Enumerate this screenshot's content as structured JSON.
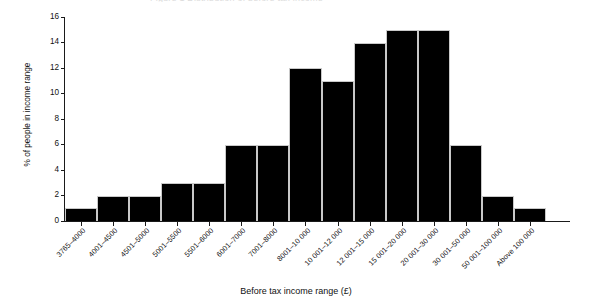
{
  "figure": {
    "title_remnant": "Figure 1  Distribution of before tax income",
    "background_color": "#ffffff",
    "bar_color": "#000000",
    "axis_color": "#1a1a1a"
  },
  "chart_data": {
    "type": "bar",
    "title": "",
    "xlabel": "Before tax income range (£)",
    "ylabel": "% of people in income range",
    "ylim": [
      0,
      16
    ],
    "yticks": [
      0,
      2,
      4,
      6,
      8,
      10,
      12,
      14,
      16
    ],
    "ytick_labels": [
      "0",
      "2",
      "4",
      "6",
      "8",
      "10",
      "12",
      "14",
      "16"
    ],
    "grid": false,
    "legend": "none",
    "categories": [
      "3765–4000",
      "4001–4500",
      "4501–5000",
      "5001–5500",
      "5501–6000",
      "6001–7000",
      "7001–8000",
      "8001–10 000",
      "10 001–12 000",
      "12 001–15 000",
      "15 001–20 000",
      "20 001–30 000",
      "30 001–50 000",
      "50 001–100 000",
      "Above 100 000"
    ],
    "values": [
      1,
      2,
      2,
      3,
      3,
      6,
      6,
      12,
      11,
      14,
      15,
      15,
      6,
      2,
      1
    ]
  }
}
